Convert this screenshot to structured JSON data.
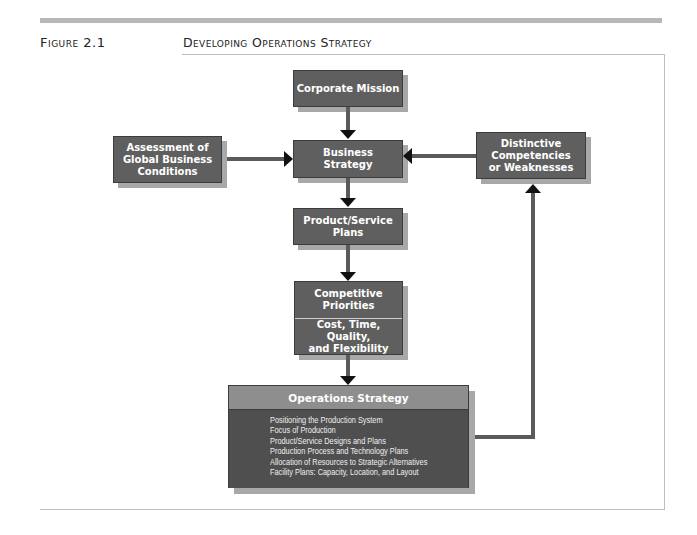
{
  "header": {
    "figure_label": "Figure 2.1",
    "figure_title": "Developing Operations Strategy"
  },
  "diagram": {
    "nodes": {
      "corporate_mission": "Corporate Mission",
      "business_strategy": "Business\nStrategy",
      "global_conditions": "Assessment of\nGlobal Business\nConditions",
      "competencies": "Distinctive\nCompetencies\nor Weaknesses",
      "product_service_plans": "Product/Service\nPlans",
      "competitive_priorities": {
        "title": "Competitive\nPriorities",
        "detail": "Cost, Time, Quality,\nand Flexibility"
      },
      "operations_strategy": {
        "title": "Operations Strategy",
        "items": [
          "Positioning the Production System",
          "Focus of Production",
          "Product/Service Designs and Plans",
          "Production Process and Technology Plans",
          "Allocation of Resources to Strategic Alternatives",
          "Facility Plans: Capacity, Location, and Layout"
        ]
      }
    },
    "edges": [
      {
        "from": "Corporate Mission",
        "to": "Business Strategy"
      },
      {
        "from": "Assessment of Global Business Conditions",
        "to": "Business Strategy"
      },
      {
        "from": "Distinctive Competencies or Weaknesses",
        "to": "Business Strategy"
      },
      {
        "from": "Business Strategy",
        "to": "Product/Service Plans"
      },
      {
        "from": "Product/Service Plans",
        "to": "Competitive Priorities"
      },
      {
        "from": "Competitive Priorities",
        "to": "Operations Strategy"
      },
      {
        "from": "Operations Strategy",
        "to": "Distinctive Competencies or Weaknesses"
      }
    ],
    "colors": {
      "box_fill": "#5f5f5f",
      "box_shadow": "#a8a8a8",
      "ops_header": "#8e8e8e",
      "ops_body": "#4f4f4f",
      "arrow": "#111111"
    }
  }
}
